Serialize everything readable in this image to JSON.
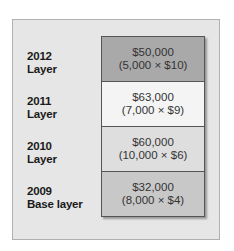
{
  "layers": [
    {
      "year": "2012",
      "label": "Layer",
      "amount": "$50,000",
      "calc": "(5,000 × $10)",
      "color": "#a9a9a9"
    },
    {
      "year": "2011",
      "label": "Layer",
      "amount": "$63,000",
      "calc": "(7,000 × $9)",
      "color": "#f4f4f4"
    },
    {
      "year": "2010",
      "label": "Layer",
      "amount": "$60,000",
      "calc": "(10,000 × $6)",
      "color": "#dedede"
    },
    {
      "year": "2009",
      "label": "Base layer",
      "amount": "$32,000",
      "calc": "(8,000 × $4)",
      "color": "#c8c8c8"
    }
  ]
}
